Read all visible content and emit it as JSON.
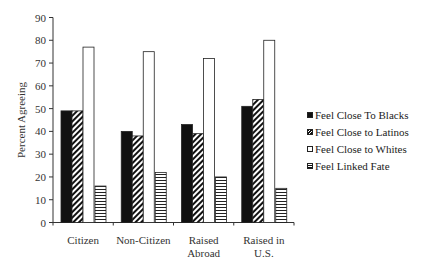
{
  "chart_data": {
    "type": "bar",
    "title": "",
    "xlabel": "",
    "ylabel": "Percent Agreeing",
    "ylim": [
      0,
      90
    ],
    "yticks": [
      0,
      10,
      20,
      30,
      40,
      50,
      60,
      70,
      80,
      90
    ],
    "grid": false,
    "legend_position": "right",
    "categories": [
      "Citizen",
      "Non-Citizen",
      "Raised Abroad",
      "Raised in U.S."
    ],
    "category_lines": [
      [
        "Citizen"
      ],
      [
        "Non-Citizen"
      ],
      [
        "Raised",
        "Abroad"
      ],
      [
        "Raised in",
        "U.S."
      ]
    ],
    "series": [
      {
        "name": "Feel Close To Blacks",
        "fill": "solid-black",
        "values": [
          49,
          40,
          43,
          51
        ]
      },
      {
        "name": "Feel Close to Latinos",
        "fill": "diagonal-hatch",
        "values": [
          49,
          38,
          39,
          54
        ]
      },
      {
        "name": "Feel Close to Whites",
        "fill": "white",
        "values": [
          77,
          75,
          72,
          80
        ]
      },
      {
        "name": "Feel Linked Fate",
        "fill": "horizontal-lines",
        "values": [
          16,
          22,
          20,
          15
        ]
      }
    ]
  },
  "legend": {
    "items": [
      {
        "label": "Feel Close To Blacks",
        "swatch": "sw-black"
      },
      {
        "label": "Feel Close to Latinos",
        "swatch": "sw-hatch"
      },
      {
        "label": "Feel Close to Whites",
        "swatch": "sw-white"
      },
      {
        "label": "Feel Linked Fate",
        "swatch": "sw-lines"
      }
    ]
  }
}
